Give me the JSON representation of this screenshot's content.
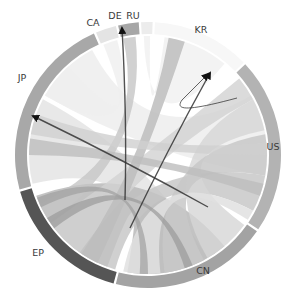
{
  "diagram": {
    "type": "chord",
    "center": [
      148,
      155
    ],
    "outer_radius": 133,
    "inner_radius": 121,
    "groups": [
      {
        "id": "CA",
        "label": "CA",
        "start": -23,
        "end": -14,
        "color": "#e4e4e4",
        "label_pos": [
          93,
          26
        ]
      },
      {
        "id": "DE",
        "label": "DE",
        "start": -13,
        "end": -4,
        "color": "#a6a6a6",
        "label_pos": [
          115,
          19
        ]
      },
      {
        "id": "RU",
        "label": "RU",
        "start": -3,
        "end": 2,
        "color": "#ececec",
        "label_pos": [
          133,
          19
        ]
      },
      {
        "id": "KR",
        "label": "KR",
        "start": 3,
        "end": 46,
        "color": "#f7f7f7",
        "label_pos": [
          201,
          33
        ]
      },
      {
        "id": "US",
        "label": "US",
        "start": 47,
        "end": 124,
        "color": "#b3b3b3",
        "label_pos": [
          273,
          150
        ]
      },
      {
        "id": "CN",
        "label": "CN",
        "start": 125,
        "end": 194,
        "color": "#a3a3a3",
        "label_pos": [
          203,
          274
        ]
      },
      {
        "id": "EP",
        "label": "EP",
        "start": 195,
        "end": 254,
        "color": "#555555",
        "label_pos": [
          38,
          256
        ]
      },
      {
        "id": "JP",
        "label": "JP",
        "start": 255,
        "end": 336,
        "color": "#a8a8a8",
        "label_pos": [
          22,
          81
        ]
      }
    ],
    "ribbons": [
      {
        "from": [
          256,
          298
        ],
        "to": [
          150,
          180
        ],
        "color": "#e6e6e6",
        "opacity": 0.9
      },
      {
        "from": [
          300,
          332
        ],
        "to": [
          60,
          100
        ],
        "color": "#eeeeee",
        "opacity": 0.9
      },
      {
        "from": [
          200,
          250
        ],
        "to": [
          140,
          190
        ],
        "color": "#b8b8b8",
        "opacity": 0.85
      },
      {
        "from": [
          196,
          215
        ],
        "to": [
          100,
          118
        ],
        "color": "#c4c4c4",
        "opacity": 0.8
      },
      {
        "from": [
          215,
          235
        ],
        "to": [
          50,
          62
        ],
        "color": "#d2d2d2",
        "opacity": 0.8
      },
      {
        "from": [
          126,
          150
        ],
        "to": [
          62,
          78
        ],
        "color": "#d6d6d6",
        "opacity": 0.8
      },
      {
        "from": [
          152,
          172
        ],
        "to": [
          80,
          100
        ],
        "color": "#c8c8c8",
        "opacity": 0.85
      },
      {
        "from": [
          174,
          192
        ],
        "to": [
          118,
          123
        ],
        "color": "#e0e0e0",
        "opacity": 0.85
      },
      {
        "from": [
          -12,
          -6
        ],
        "to": [
          236,
          246
        ],
        "color": "#c6c6c6",
        "opacity": 0.8
      },
      {
        "from": [
          -22,
          -15
        ],
        "to": [
          300,
          318
        ],
        "color": "#efefef",
        "opacity": 0.8
      },
      {
        "from": [
          -2,
          1
        ],
        "to": [
          8,
          40
        ],
        "color": "#f2f2f2",
        "opacity": 0.9
      },
      {
        "from": [
          10,
          18
        ],
        "to": [
          205,
          214
        ],
        "color": "#bdbdbd",
        "opacity": 0.85
      },
      {
        "from": [
          270,
          278
        ],
        "to": [
          104,
          110
        ],
        "color": "#bdbdbd",
        "opacity": 0.8
      },
      {
        "from": [
          280,
          290
        ],
        "to": [
          84,
          90
        ],
        "color": "#d0d0d0",
        "opacity": 0.8
      },
      {
        "from": [
          158,
          162
        ],
        "to": [
          232,
          238
        ],
        "color": "#9a9a9a",
        "opacity": 0.7
      },
      {
        "from": [
          180,
          184
        ],
        "to": [
          244,
          249
        ],
        "color": "#a0a0a0",
        "opacity": 0.7
      }
    ],
    "arrows": [
      {
        "from": [
          125,
          200
        ],
        "to": [
          122,
          28
        ],
        "label": "EP-to-DE"
      },
      {
        "from": [
          130,
          228
        ],
        "to": [
          210,
          73
        ],
        "label": "CN-to-KR"
      },
      {
        "from": [
          208,
          207
        ],
        "to": [
          33,
          116
        ],
        "label": "CN-to-JP"
      },
      {
        "from": [
          237,
          98
        ],
        "to": [
          208,
          74
        ],
        "label": "US-to-KR-curve",
        "curved": true
      }
    ]
  }
}
